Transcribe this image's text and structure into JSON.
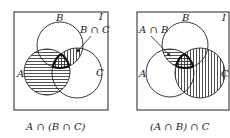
{
  "diagrams": [
    {
      "universe_label": "I",
      "labels": {
        "A": "A",
        "B": "B",
        "C": "C"
      },
      "callout": "B ∩ C",
      "caption": "A ∩ (B ∩ C)"
    },
    {
      "universe_label": "I",
      "labels": {
        "A": "A",
        "B": "B",
        "C": "C"
      },
      "callout": "A ∩ B",
      "caption": "(A ∩ B) ∩ C"
    }
  ],
  "colors": {
    "ink": "#222222",
    "background": "#ffffff"
  }
}
